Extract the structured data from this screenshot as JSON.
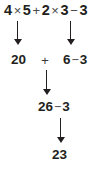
{
  "diagram": {
    "background_color": "#ffffff",
    "text_color": "#231f20",
    "operator_color": "#4a4a4a",
    "arrow_color": "#231f20",
    "steps": [
      {
        "id": "step-1",
        "label": "original-expression",
        "text": "4 × 5 + 2 × 3 − 3",
        "tokens": [
          "4",
          "×",
          "5",
          "+",
          "2",
          "×",
          "3",
          "−",
          "3"
        ]
      },
      {
        "id": "step-2",
        "label": "after-multiplication",
        "text": "20 + 6 − 3",
        "tokens": [
          "20",
          "+",
          "6",
          "−",
          "3"
        ]
      },
      {
        "id": "step-3",
        "label": "after-addition",
        "text": "26 − 3",
        "tokens": [
          "26",
          "−",
          "3"
        ]
      },
      {
        "id": "step-4",
        "label": "final-answer",
        "text": "23",
        "tokens": [
          "23"
        ]
      }
    ],
    "line1": {
      "n1": "4",
      "times1": "×",
      "n2": "5",
      "plus": "+",
      "n3": "2",
      "times2": "×",
      "n4": "3",
      "minus": "−",
      "n5": "3"
    },
    "line2": {
      "product1": "20",
      "plus": "+",
      "product2_minus3": "6 − 3",
      "product2": "6",
      "minus": "−",
      "n3": "3"
    },
    "line3": {
      "sum_minus3": "26 − 3",
      "sum": "26",
      "minus": "−",
      "n3": "3"
    },
    "line4": {
      "answer": "23"
    },
    "arrows": [
      {
        "id": "arrow-1",
        "from": "4 × 5",
        "to": "20"
      },
      {
        "id": "arrow-2",
        "from": "2 × 3",
        "to": "6"
      },
      {
        "id": "arrow-3",
        "from": "20 + 6",
        "to": "26"
      },
      {
        "id": "arrow-4",
        "from": "26 − 3",
        "to": "23"
      }
    ]
  }
}
